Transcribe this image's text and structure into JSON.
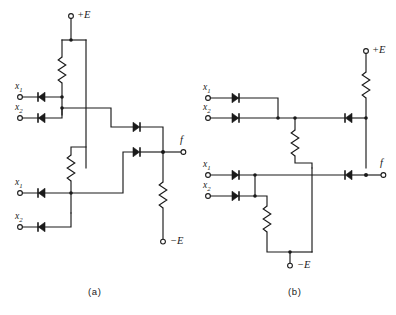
{
  "figure": {
    "background_color": "#ffffff",
    "line_color": "#1a1a1a",
    "width": 396,
    "height": 315
  },
  "circuits": [
    {
      "id": "a",
      "caption": "(a)",
      "supply_positive": "+E",
      "supply_negative": "−E",
      "output_label": "f",
      "inputs": [
        {
          "label": "x",
          "subscript": "1",
          "group": "upper"
        },
        {
          "label": "x",
          "subscript": "2",
          "group": "upper"
        },
        {
          "label": "x",
          "subscript": "1",
          "group": "lower"
        },
        {
          "label": "x",
          "subscript": "2",
          "group": "lower"
        }
      ],
      "component_counts": {
        "diodes": 6,
        "resistors": 3,
        "terminals": 7
      }
    },
    {
      "id": "b",
      "caption": "(b)",
      "supply_positive": "+E",
      "supply_negative": "−E",
      "output_label": "f",
      "inputs": [
        {
          "label": "x",
          "subscript": "1",
          "group": "upper"
        },
        {
          "label": "x",
          "subscript": "2",
          "group": "upper"
        },
        {
          "label": "x",
          "subscript": "1",
          "group": "lower"
        },
        {
          "label": "x",
          "subscript": "2",
          "group": "lower"
        }
      ],
      "component_counts": {
        "diodes": 6,
        "resistors": 3,
        "terminals": 7
      }
    }
  ],
  "labels": {
    "a_plus_e": "+E",
    "a_minus_e": "−E",
    "a_f": "f",
    "a_x1_top": "x",
    "a_x1_top_sub": "1",
    "a_x2_top": "x",
    "a_x2_top_sub": "2",
    "a_x1_bot": "x",
    "a_x1_bot_sub": "1",
    "a_x2_bot": "x",
    "a_x2_bot_sub": "2",
    "a_caption": "(a)",
    "b_plus_e": "+E",
    "b_minus_e": "−E",
    "b_f": "f",
    "b_x1_top": "x",
    "b_x1_top_sub": "1",
    "b_x2_top": "x",
    "b_x2_top_sub": "2",
    "b_x1_bot": "x",
    "b_x1_bot_sub": "1",
    "b_x2_bot": "x",
    "b_x2_bot_sub": "2",
    "b_caption": "(b)"
  }
}
